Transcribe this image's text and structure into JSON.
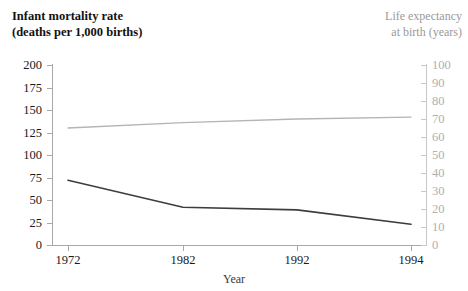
{
  "figure": {
    "left_axis_title_line1": "Infant mortality rate",
    "left_axis_title_line2": "(deaths per 1,000 births)",
    "right_axis_title_line1": "Life expectancy",
    "right_axis_title_line2": "at birth (years)",
    "x_axis_title": "Year"
  },
  "colors": {
    "infant_mortality_line": "#3d3d3d",
    "life_expectancy_line": "#b4b4b4",
    "left_axis": "#a8a8a8",
    "right_axis": "#c9c9c9",
    "left_text": "#111111",
    "right_text": "#9a9a9a"
  },
  "chart_data": {
    "type": "line",
    "title": "",
    "subtitle": "",
    "xlabel": "Year",
    "ylabel": "Infant mortality rate (deaths per 1,000 births)",
    "y2label": "Life expectancy at birth (years)",
    "x": [
      "1972",
      "1982",
      "1992",
      "1994"
    ],
    "categories": [
      "1972",
      "1982",
      "1992",
      "1994"
    ],
    "xtick_labels": [
      "1972",
      "1982",
      "1992",
      "1994"
    ],
    "ytick_labels_left": [
      "200",
      "175",
      "150",
      "125",
      "100",
      "75",
      "50",
      "25",
      "0"
    ],
    "ytick_values_left": [
      200,
      175,
      150,
      125,
      100,
      75,
      50,
      25,
      0
    ],
    "ytick_labels_right": [
      "100",
      "90",
      "80",
      "70",
      "60",
      "50",
      "40",
      "30",
      "20",
      "10",
      "0"
    ],
    "ytick_values_right": [
      100,
      90,
      80,
      70,
      60,
      50,
      40,
      30,
      20,
      10,
      0
    ],
    "ylim": [
      0,
      200
    ],
    "y2lim": [
      0,
      100
    ],
    "grid": false,
    "legend": "none",
    "series": [
      {
        "name": "Infant mortality rate",
        "axis": "left",
        "color": "#3d3d3d",
        "values": [
          72,
          42,
          39,
          23
        ]
      },
      {
        "name": "Life expectancy at birth",
        "axis": "right",
        "color": "#b4b4b4",
        "values": [
          65,
          68,
          70,
          71
        ]
      }
    ]
  }
}
